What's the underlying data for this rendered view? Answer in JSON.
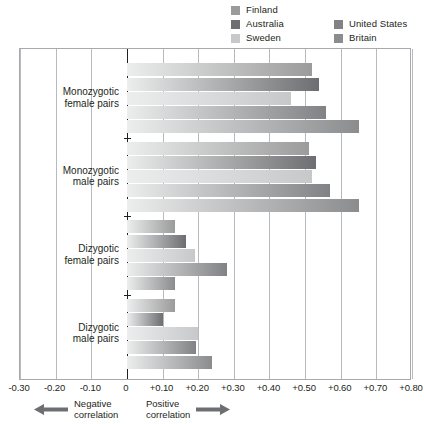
{
  "legend": {
    "columns": [
      {
        "items": [
          {
            "label": "Finland",
            "color": "#9b9b9b"
          },
          {
            "label": "Australia",
            "color": "#6d6e71"
          },
          {
            "label": "Sweden",
            "color": "#c7c8ca"
          }
        ]
      },
      {
        "items": [
          {
            "label": "United States",
            "color": "#808285"
          },
          {
            "label": "Britain",
            "color": "#8a8c8e"
          }
        ]
      }
    ]
  },
  "footer": {
    "negative": {
      "text": "Negative\ncorrelation",
      "arrow_icon": "arrow-left-icon"
    },
    "positive": {
      "text": "Positive\ncorrelation",
      "arrow_icon": "arrow-right-icon"
    }
  },
  "chart_data": {
    "type": "bar",
    "orientation": "horizontal",
    "title": "",
    "xlabel": "",
    "ylabel": "",
    "xlim": [
      -0.3,
      0.8
    ],
    "xtick_step": 0.1,
    "grid": true,
    "legend_position": "top-right",
    "xticks": [
      "-0.30",
      "-0.20",
      "-0.10",
      "0",
      "+0.10",
      "+0.20",
      "+0.30",
      "+0.40",
      "+0.50",
      "+0.60",
      "+0.70",
      "+0.80"
    ],
    "xtick_values": [
      -0.3,
      -0.2,
      -0.1,
      0,
      0.1,
      0.2,
      0.3,
      0.4,
      0.5,
      0.6,
      0.7,
      0.8
    ],
    "categories": [
      "Monozygotic\nfemale pairs",
      "Monozygotic\nmale pairs",
      "Dizygotic\nfemale pairs",
      "Dizygotic\nmale pairs"
    ],
    "series": [
      {
        "name": "Finland",
        "color": "#9b9b9b",
        "values": [
          0.52,
          0.51,
          0.135,
          0.135
        ]
      },
      {
        "name": "Australia",
        "color": "#6d6e71",
        "values": [
          0.54,
          0.53,
          0.165,
          0.1
        ]
      },
      {
        "name": "Sweden",
        "color": "#c7c8ca",
        "values": [
          0.46,
          0.52,
          0.19,
          0.2
        ]
      },
      {
        "name": "United States",
        "color": "#808285",
        "values": [
          0.56,
          0.57,
          0.28,
          0.195
        ]
      },
      {
        "name": "Britain",
        "color": "#8a8c8e",
        "values": [
          0.65,
          0.65,
          0.135,
          0.24
        ]
      }
    ]
  }
}
